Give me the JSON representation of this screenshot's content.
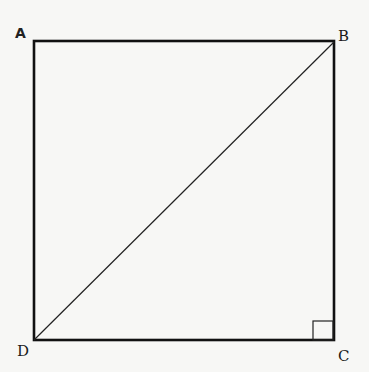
{
  "diagram": {
    "type": "square-with-diagonal",
    "vertices": [
      {
        "label": "A",
        "x": 34,
        "y": 41
      },
      {
        "label": "B",
        "x": 334,
        "y": 42
      },
      {
        "label": "C",
        "x": 334,
        "y": 340
      },
      {
        "label": "D",
        "x": 34,
        "y": 340
      }
    ],
    "diagonal": [
      "D",
      "B"
    ],
    "right_angle_marker_at": "C",
    "colors": {
      "stroke": "#111111",
      "background": "#f7f7f5"
    }
  },
  "labels": {
    "A": "A",
    "B": "B",
    "C": "C",
    "D": "D"
  }
}
